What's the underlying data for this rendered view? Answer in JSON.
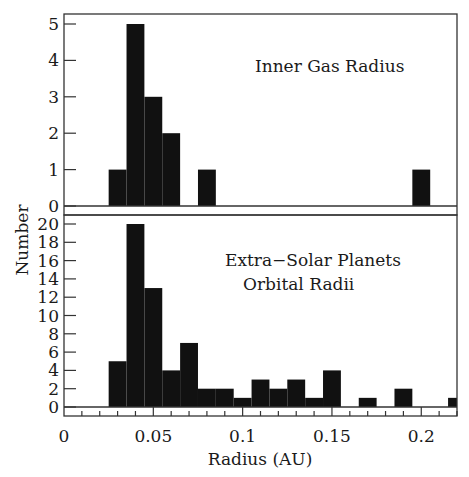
{
  "chart_data": [
    {
      "type": "bar",
      "panel": "top",
      "title": "Inner Gas Radius",
      "annotation": [
        "Inner Gas Radius"
      ],
      "xlabel": "Radius (AU)",
      "ylabel": "Number",
      "xlim": [
        0,
        0.22
      ],
      "ylim": [
        0,
        5.3
      ],
      "yticks": [
        0,
        1,
        2,
        3,
        4,
        5
      ],
      "bin_width": 0.01,
      "bins": [
        {
          "x0": 0.025,
          "x1": 0.035,
          "count": 1
        },
        {
          "x0": 0.035,
          "x1": 0.045,
          "count": 5
        },
        {
          "x0": 0.045,
          "x1": 0.055,
          "count": 3
        },
        {
          "x0": 0.055,
          "x1": 0.065,
          "count": 2
        },
        {
          "x0": 0.075,
          "x1": 0.085,
          "count": 1
        },
        {
          "x0": 0.195,
          "x1": 0.205,
          "count": 1
        }
      ],
      "grid": false,
      "bar_color": "#111111"
    },
    {
      "type": "bar",
      "panel": "bottom",
      "title": "Extra-Solar Planets Orbital Radii",
      "annotation": [
        "Extra−Solar Planets",
        "Orbital Radii"
      ],
      "xlabel": "Radius (AU)",
      "ylabel": "Number",
      "xlim": [
        0,
        0.22
      ],
      "ylim": [
        0,
        21
      ],
      "yticks": [
        0,
        2,
        4,
        6,
        8,
        10,
        12,
        14,
        16,
        18,
        20
      ],
      "xticks": [
        0,
        0.05,
        0.1,
        0.15,
        0.2
      ],
      "xtick_labels": [
        "0",
        "0.05",
        "0.1",
        "0.15",
        "0.2"
      ],
      "bin_width": 0.01,
      "bins": [
        {
          "x0": 0.025,
          "x1": 0.035,
          "count": 5
        },
        {
          "x0": 0.035,
          "x1": 0.045,
          "count": 20
        },
        {
          "x0": 0.045,
          "x1": 0.055,
          "count": 13
        },
        {
          "x0": 0.055,
          "x1": 0.065,
          "count": 4
        },
        {
          "x0": 0.065,
          "x1": 0.075,
          "count": 7
        },
        {
          "x0": 0.075,
          "x1": 0.085,
          "count": 2
        },
        {
          "x0": 0.085,
          "x1": 0.095,
          "count": 2
        },
        {
          "x0": 0.095,
          "x1": 0.105,
          "count": 1
        },
        {
          "x0": 0.105,
          "x1": 0.115,
          "count": 3
        },
        {
          "x0": 0.115,
          "x1": 0.125,
          "count": 2
        },
        {
          "x0": 0.125,
          "x1": 0.135,
          "count": 3
        },
        {
          "x0": 0.135,
          "x1": 0.145,
          "count": 1
        },
        {
          "x0": 0.145,
          "x1": 0.155,
          "count": 4
        },
        {
          "x0": 0.165,
          "x1": 0.175,
          "count": 1
        },
        {
          "x0": 0.185,
          "x1": 0.195,
          "count": 2
        },
        {
          "x0": 0.215,
          "x1": 0.22,
          "count": 1
        }
      ],
      "grid": false,
      "bar_color": "#111111"
    }
  ],
  "axes": {
    "ylabel": "Number",
    "xlabel": "Radius (AU)"
  }
}
